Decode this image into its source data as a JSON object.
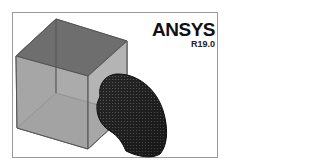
{
  "app": {
    "brand": "ANSYS",
    "version": "R19.0"
  },
  "scene": {
    "objects": [
      {
        "name": "enclosure-cube",
        "style": "transparent-gray"
      },
      {
        "name": "pipe-elbow",
        "style": "meshed-dark"
      }
    ]
  },
  "colors": {
    "frame": "#9a9a9a",
    "cube_edge": "#555555",
    "cube_top": "#6e6e6e",
    "cube_face": "#a8a8a8",
    "mesh": "#1e1e1e"
  }
}
